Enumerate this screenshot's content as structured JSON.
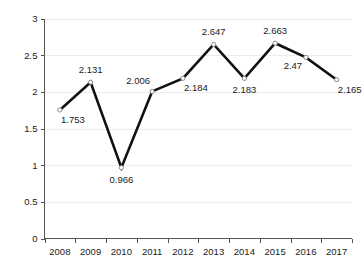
{
  "chart_data": {
    "type": "line",
    "title": "",
    "subtitle": "",
    "xlabel": "",
    "ylabel": "",
    "categories": [
      "2008",
      "2009",
      "2010",
      "2011",
      "2012",
      "2013",
      "2014",
      "2015",
      "2016",
      "2017"
    ],
    "values": [
      1.753,
      2.131,
      0.966,
      2.006,
      2.184,
      2.647,
      2.183,
      2.663,
      2.47,
      2.165
    ],
    "point_labels": [
      "1.753",
      "2.131",
      "0.966",
      "2.006",
      "2.184",
      "2.647",
      "2.183",
      "2.663",
      "2.47",
      "2.165"
    ],
    "label_positions": [
      "below-right",
      "above",
      "below",
      "above-left",
      "below-right",
      "above",
      "below",
      "above",
      "below-left",
      "below-right"
    ],
    "ylim": [
      0,
      3
    ],
    "ytick_values": [
      0,
      0.5,
      1,
      1.5,
      2,
      2.5,
      3
    ],
    "ytick_labels": [
      "0",
      "0.5",
      "1",
      "1.5",
      "2",
      "2.5",
      "3"
    ],
    "xtick_labels": [
      "2008",
      "2009",
      "2010",
      "2011",
      "2012",
      "2013",
      "2014",
      "2015",
      "2016",
      "2017"
    ],
    "grid": true,
    "grid_axis": "y",
    "legend": false,
    "legend_position": "none",
    "series": [
      {
        "name": "",
        "values": [
          1.753,
          2.131,
          0.966,
          2.006,
          2.184,
          2.647,
          2.183,
          2.663,
          2.47,
          2.165
        ]
      }
    ],
    "colors": {
      "line": "#111111",
      "marker_fill": "#ffffff",
      "marker_stroke": "#8a8a8a",
      "grid": "#ececec",
      "axis": "#555555",
      "text": "#1a1a1a",
      "background": "#ffffff"
    }
  }
}
